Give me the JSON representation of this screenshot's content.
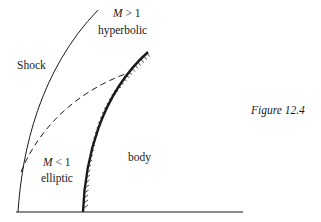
{
  "diagram": {
    "labels": {
      "supersonic_region": "M > 1",
      "supersonic_type": "hyperbolic",
      "shock": "Shock",
      "subsonic_region": "M < 1",
      "subsonic_type": "elliptic",
      "body": "body"
    },
    "caption": "Figure 12.4",
    "colors": {
      "line": "#1a1a1a",
      "background": "#ffffff"
    }
  }
}
